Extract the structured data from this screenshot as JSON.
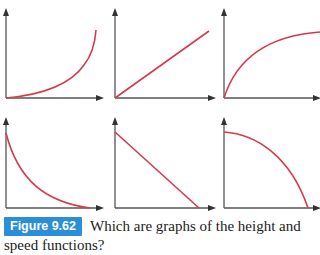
{
  "figure": {
    "label": "Figure 9.62",
    "caption": "Which are graphs of the height and speed functions?",
    "accent_color": "#2a8fd6",
    "curve_color": "#d63a4a"
  },
  "graphs": [
    {
      "position": "top-left",
      "shape": "increasing, concave up"
    },
    {
      "position": "top-middle",
      "shape": "increasing, linear"
    },
    {
      "position": "top-right",
      "shape": "increasing, concave down"
    },
    {
      "position": "bottom-left",
      "shape": "decreasing, concave up"
    },
    {
      "position": "bottom-middle",
      "shape": "decreasing, linear"
    },
    {
      "position": "bottom-right",
      "shape": "decreasing, concave down"
    }
  ]
}
